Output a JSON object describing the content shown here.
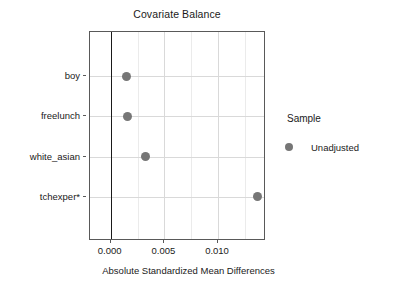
{
  "chart_data": {
    "type": "scatter",
    "title": "Covariate Balance",
    "xlabel": "Absolute Standardized Mean Differences",
    "ylabel": "",
    "xlim": [
      -0.00193,
      0.01447
    ],
    "xticks": [
      0.0,
      0.005,
      0.01
    ],
    "xticklabels": [
      "0.000",
      "0.005",
      "0.010"
    ],
    "categories": [
      "boy",
      "freelunch",
      "white_asian",
      "tchexper*"
    ],
    "grid": true,
    "legend_position": "right",
    "reference_line_x": 0.0,
    "series": [
      {
        "name": "Unadjusted",
        "color": "#767676",
        "marker": "circle",
        "points": [
          {
            "category": "boy",
            "value": 0.0015
          },
          {
            "category": "freelunch",
            "value": 0.0016
          },
          {
            "category": "white_asian",
            "value": 0.0032
          },
          {
            "category": "tchexper*",
            "value": 0.0137
          }
        ]
      }
    ]
  },
  "legend": {
    "title": "Sample",
    "entries": [
      {
        "label": "Unadjusted",
        "color": "#767676"
      }
    ]
  },
  "colors": {
    "point": "#767676",
    "panel_border": "#595959",
    "gridline": "#d9d9d9",
    "zero_line": "#1a1a1a",
    "background": "#ffffff",
    "text": "#1a1a1a"
  }
}
